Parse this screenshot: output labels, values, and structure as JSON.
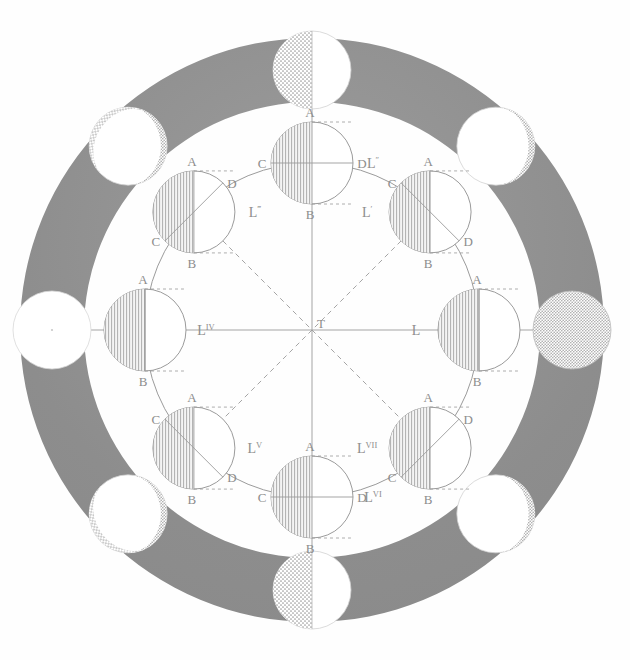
{
  "figure": {
    "center_label": "T",
    "colors": {
      "ring_fill": "#8c8c8c",
      "ring_fill_light": "#9a9a9a",
      "background": "#fefefe",
      "line": "#9b9b9b",
      "label": "#8d8d8d",
      "hatch": "#a8a8a8",
      "stipple": "#b4b4b4",
      "white": "#ffffff"
    },
    "geometry": {
      "cx": 312,
      "cy": 330,
      "ring_outer_r": 292,
      "ring_inner_r": 228,
      "orbit_r": 167,
      "moon_r": 41,
      "outer_moon_r": 39,
      "outer_moon_ring_r": 260
    }
  },
  "inner_moons": [
    {
      "id": "L",
      "label": "L",
      "sup": "",
      "angle_deg": 0,
      "label_side": "left",
      "points": {
        "A": "A",
        "B": "B",
        "C": "",
        "D": ""
      },
      "terminator_deg": 0,
      "lit_side": "right",
      "show_cd": false
    },
    {
      "id": "L1",
      "label": "L",
      "sup": "′",
      "angle_deg": 45,
      "label_side": "left",
      "points": {
        "A": "A",
        "B": "B",
        "C": "C",
        "D": "D"
      },
      "terminator_deg": 45,
      "lit_side": "right",
      "show_cd": true
    },
    {
      "id": "L2",
      "label": "L",
      "sup": "″",
      "angle_deg": 90,
      "label_side": "right",
      "points": {
        "A": "A",
        "B": "B",
        "C": "C",
        "D": "D"
      },
      "terminator_deg": 90,
      "lit_side": "right",
      "show_cd": true
    },
    {
      "id": "L3",
      "label": "L",
      "sup": "‴",
      "angle_deg": 135,
      "label_side": "right",
      "points": {
        "A": "A",
        "B": "B",
        "C": "C",
        "D": "D"
      },
      "terminator_deg": 135,
      "lit_side": "right",
      "show_cd": true
    },
    {
      "id": "L4",
      "label": "L",
      "sup": "IV",
      "angle_deg": 180,
      "label_side": "right",
      "points": {
        "A": "A",
        "B": "B",
        "C": "",
        "D": ""
      },
      "terminator_deg": 180,
      "lit_side": "right",
      "show_cd": false
    },
    {
      "id": "L5",
      "label": "L",
      "sup": "V",
      "angle_deg": 225,
      "label_side": "right",
      "points": {
        "A": "A",
        "B": "B",
        "C": "C",
        "D": "D"
      },
      "terminator_deg": 225,
      "lit_side": "right",
      "show_cd": true
    },
    {
      "id": "L6",
      "label": "L",
      "sup": "VI",
      "angle_deg": 270,
      "label_side": "right",
      "points": {
        "A": "A",
        "B": "B",
        "C": "C",
        "D": "D"
      },
      "terminator_deg": 270,
      "lit_side": "right",
      "show_cd": true
    },
    {
      "id": "L7",
      "label": "L",
      "sup": "VII",
      "angle_deg": 315,
      "label_side": "left",
      "points": {
        "A": "A",
        "B": "B",
        "C": "C",
        "D": "D"
      },
      "terminator_deg": 315,
      "lit_side": "right",
      "show_cd": true
    }
  ],
  "outer_phases": [
    {
      "id": "phase-right",
      "angle_deg": 0,
      "phase": "full",
      "illuminated_fraction": 1.0
    },
    {
      "id": "phase-upper-right",
      "angle_deg": 45,
      "phase": "waxing-gibbous",
      "illuminated_fraction": 0.92
    },
    {
      "id": "phase-top",
      "angle_deg": 90,
      "phase": "first-quarter",
      "illuminated_fraction": 0.5
    },
    {
      "id": "phase-upper-left",
      "angle_deg": 135,
      "phase": "waxing-crescent",
      "illuminated_fraction": 0.08
    },
    {
      "id": "phase-left",
      "angle_deg": 180,
      "phase": "new",
      "illuminated_fraction": 0.0
    },
    {
      "id": "phase-lower-left",
      "angle_deg": 225,
      "phase": "waning-crescent",
      "illuminated_fraction": 0.08
    },
    {
      "id": "phase-bottom",
      "angle_deg": 270,
      "phase": "last-quarter",
      "illuminated_fraction": 0.5
    },
    {
      "id": "phase-lower-right",
      "angle_deg": 315,
      "phase": "waning-gibbous",
      "illuminated_fraction": 0.92
    }
  ]
}
